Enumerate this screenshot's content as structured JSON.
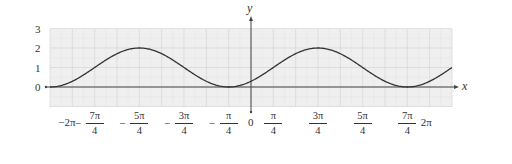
{
  "chart_data": {
    "type": "line",
    "title": "",
    "function": "y = 1 + sin(x - π/4)",
    "xlabel": "x",
    "ylabel": "y",
    "xlim_in_pi_over_4": [
      -9,
      9
    ],
    "ylim": [
      -1,
      3
    ],
    "grid": true,
    "legend": null,
    "y_ticks": [
      {
        "value": 0,
        "label": "0"
      },
      {
        "value": 1,
        "label": "1"
      },
      {
        "value": 2,
        "label": "2"
      },
      {
        "value": 3,
        "label": "3"
      }
    ],
    "x_ticks": [
      {
        "value_pi_over_4": -8,
        "label": "−2π",
        "num": "",
        "den": "",
        "sign": ""
      },
      {
        "value_pi_over_4": -7,
        "label": "−7π/4",
        "num": "7π",
        "den": "4",
        "sign": "−"
      },
      {
        "value_pi_over_4": -5,
        "label": "−5π/4",
        "num": "5π",
        "den": "4",
        "sign": "−"
      },
      {
        "value_pi_over_4": -3,
        "label": "−3π/4",
        "num": "3π",
        "den": "4",
        "sign": "−"
      },
      {
        "value_pi_over_4": -1,
        "label": "−π/4",
        "num": "π",
        "den": "4",
        "sign": "−"
      },
      {
        "value_pi_over_4": 0,
        "label": "0",
        "num": "",
        "den": "",
        "sign": ""
      },
      {
        "value_pi_over_4": 1,
        "label": "π/4",
        "num": "π",
        "den": "4",
        "sign": ""
      },
      {
        "value_pi_over_4": 3,
        "label": "3π/4",
        "num": "3π",
        "den": "4",
        "sign": ""
      },
      {
        "value_pi_over_4": 5,
        "label": "5π/4",
        "num": "5π",
        "den": "4",
        "sign": ""
      },
      {
        "value_pi_over_4": 7,
        "label": "7π/4",
        "num": "7π",
        "den": "4",
        "sign": ""
      },
      {
        "value_pi_over_4": 8,
        "label": "2π",
        "num": "",
        "den": "",
        "sign": ""
      }
    ],
    "series": [
      {
        "name": "y = 1 + sin(x - π/4)",
        "x_pi_over_4": [
          -9,
          -8,
          -7,
          -6,
          -5,
          -4,
          -3,
          -2,
          -1,
          0,
          1,
          2,
          3,
          4,
          5,
          6,
          7,
          8,
          9
        ],
        "values": [
          0,
          0.29,
          1,
          1.71,
          2,
          1.71,
          1,
          0.29,
          0,
          0.29,
          1,
          1.71,
          2,
          1.71,
          1,
          0.29,
          0,
          0.29,
          1
        ]
      }
    ],
    "key_points": {
      "maxima": [
        {
          "x": "−5π/4",
          "y": 2
        },
        {
          "x": "3π/4",
          "y": 2
        }
      ],
      "minima": [
        {
          "x": "−π/4",
          "y": 0
        },
        {
          "x": "7π/4",
          "y": 0
        }
      ]
    },
    "colors": {
      "plot_background": "#efefef",
      "grid_major": "#d6d6d6",
      "grid_minor": "#e4e4e4",
      "curve": "#333333",
      "axis": "#444444",
      "text": "#333333"
    }
  }
}
